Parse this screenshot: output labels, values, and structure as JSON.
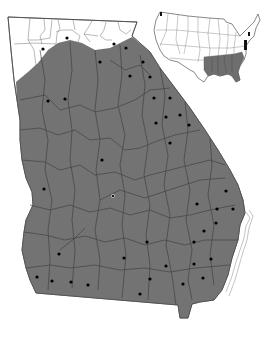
{
  "map": {
    "title": "Georgia county distribution map",
    "region": "Georgia",
    "inset_region": "Contiguous United States",
    "colors": {
      "background": "#ffffff",
      "range_fill": "#737373",
      "unshaded_fill": "#ffffff",
      "county_lines": "#3a3a3a",
      "outline": "#555555",
      "dot": "#000000",
      "inset_fill": "#6e6e6e",
      "inset_mark": "#111111"
    },
    "legend": {
      "shaded": "range",
      "dot": "county record"
    },
    "georgia_outline": [
      [
        8,
        17
      ],
      [
        137,
        22
      ],
      [
        132,
        36
      ],
      [
        150,
        52
      ],
      [
        160,
        68
      ],
      [
        175,
        88
      ],
      [
        190,
        108
      ],
      [
        205,
        130
      ],
      [
        218,
        150
      ],
      [
        230,
        170
      ],
      [
        238,
        185
      ],
      [
        243,
        200
      ],
      [
        245,
        213
      ],
      [
        240,
        225
      ],
      [
        238,
        240
      ],
      [
        232,
        258
      ],
      [
        228,
        275
      ],
      [
        222,
        290
      ],
      [
        214,
        300
      ],
      [
        200,
        302
      ],
      [
        192,
        304
      ],
      [
        188,
        318
      ],
      [
        180,
        318
      ],
      [
        178,
        305
      ],
      [
        36,
        293
      ],
      [
        30,
        280
      ],
      [
        26,
        268
      ],
      [
        22,
        250
      ],
      [
        24,
        232
      ],
      [
        26,
        220
      ],
      [
        33,
        205
      ],
      [
        32,
        192
      ],
      [
        26,
        178
      ],
      [
        22,
        160
      ],
      [
        20,
        140
      ],
      [
        20,
        120
      ],
      [
        17,
        100
      ],
      [
        14,
        80
      ],
      [
        11,
        50
      ]
    ],
    "range_polygon": [
      [
        16,
        82
      ],
      [
        28,
        72
      ],
      [
        38,
        63
      ],
      [
        48,
        50
      ],
      [
        58,
        43
      ],
      [
        70,
        40
      ],
      [
        82,
        43
      ],
      [
        95,
        50
      ],
      [
        110,
        48
      ],
      [
        120,
        43
      ],
      [
        132,
        37
      ],
      [
        150,
        52
      ],
      [
        160,
        68
      ],
      [
        175,
        88
      ],
      [
        190,
        108
      ],
      [
        205,
        130
      ],
      [
        218,
        150
      ],
      [
        230,
        170
      ],
      [
        238,
        185
      ],
      [
        243,
        200
      ],
      [
        245,
        213
      ],
      [
        240,
        225
      ],
      [
        238,
        240
      ],
      [
        232,
        258
      ],
      [
        228,
        275
      ],
      [
        222,
        290
      ],
      [
        214,
        300
      ],
      [
        200,
        302
      ],
      [
        192,
        304
      ],
      [
        188,
        318
      ],
      [
        180,
        318
      ],
      [
        178,
        305
      ],
      [
        36,
        293
      ],
      [
        30,
        280
      ],
      [
        26,
        268
      ],
      [
        22,
        250
      ],
      [
        24,
        232
      ],
      [
        26,
        220
      ],
      [
        33,
        205
      ],
      [
        32,
        192
      ],
      [
        26,
        178
      ],
      [
        22,
        160
      ],
      [
        20,
        140
      ],
      [
        20,
        120
      ],
      [
        17,
        100
      ]
    ],
    "dots": [
      [
        67,
        38
      ],
      [
        43,
        49
      ],
      [
        114,
        44
      ],
      [
        126,
        48
      ],
      [
        100,
        62
      ],
      [
        143,
        62
      ],
      [
        130,
        76
      ],
      [
        150,
        77
      ],
      [
        48,
        101
      ],
      [
        65,
        99
      ],
      [
        154,
        98
      ],
      [
        170,
        98
      ],
      [
        166,
        117
      ],
      [
        180,
        115
      ],
      [
        156,
        123
      ],
      [
        189,
        125
      ],
      [
        170,
        143
      ],
      [
        102,
        160
      ],
      [
        44,
        189
      ],
      [
        113,
        196
      ],
      [
        226,
        191
      ],
      [
        197,
        204
      ],
      [
        217,
        209
      ],
      [
        233,
        209
      ],
      [
        216,
        223
      ],
      [
        204,
        231
      ],
      [
        194,
        242
      ],
      [
        211,
        259
      ],
      [
        194,
        264
      ],
      [
        166,
        266
      ],
      [
        203,
        278
      ],
      [
        183,
        284
      ],
      [
        147,
        242
      ],
      [
        124,
        258
      ],
      [
        59,
        254
      ],
      [
        37,
        277
      ],
      [
        52,
        281
      ],
      [
        71,
        282
      ],
      [
        88,
        285
      ],
      [
        150,
        279
      ],
      [
        140,
        294
      ]
    ],
    "ringed_dots": [
      [
        113,
        196
      ]
    ],
    "inset": {
      "x": 154,
      "y": 10,
      "width": 106,
      "height": 72,
      "shaded_states": [
        "Louisiana",
        "Mississippi",
        "Alabama",
        "Georgia",
        "Florida",
        "South Carolina"
      ],
      "marked_states": [
        "Washington",
        "New Jersey",
        "Delaware",
        "Maryland"
      ]
    }
  }
}
